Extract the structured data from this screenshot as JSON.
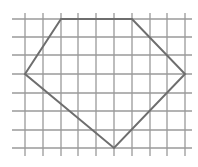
{
  "diagram": {
    "type": "polygon-on-grid",
    "grid": {
      "vertical_lines_x": [
        25,
        43,
        61,
        78,
        96,
        114,
        132,
        150,
        167,
        185
      ],
      "horizontal_lines_y": [
        19,
        37,
        55,
        74,
        93,
        111,
        130,
        148
      ],
      "x_extent": [
        12,
        192
      ],
      "y_extent": [
        13,
        156
      ],
      "line_color": "#9a9a9a",
      "line_width": 1.3
    },
    "polygon": {
      "shape": "pentagon",
      "vertices_px": [
        [
          61,
          19
        ],
        [
          132,
          19
        ],
        [
          185,
          74
        ],
        [
          114,
          148
        ],
        [
          25,
          74
        ]
      ],
      "vertices_grid": [
        [
          2,
          0
        ],
        [
          6,
          0
        ],
        [
          9,
          3
        ],
        [
          5,
          7
        ],
        [
          0,
          3
        ]
      ],
      "stroke_color": "#6e6e6e",
      "stroke_width": 2
    }
  }
}
